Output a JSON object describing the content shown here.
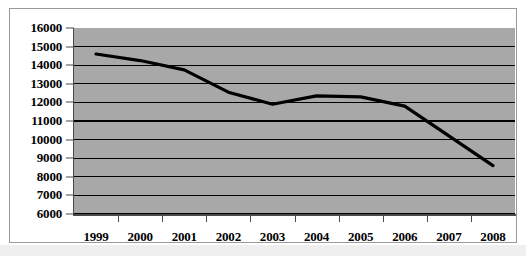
{
  "chart_data": {
    "type": "line",
    "title": "",
    "subtitle": "",
    "xlabel": "",
    "ylabel": "",
    "categories": [
      "1999",
      "2000",
      "2001",
      "2002",
      "2003",
      "2004",
      "2005",
      "2006",
      "2007",
      "2008"
    ],
    "values": [
      14600,
      14250,
      13750,
      12550,
      11900,
      12350,
      12300,
      11800,
      10200,
      8600
    ],
    "series": [
      {
        "name": "",
        "values": [
          14600,
          14250,
          13750,
          12550,
          11900,
          12350,
          12300,
          11800,
          10200,
          8600
        ]
      }
    ],
    "ylim": [
      6000,
      16000
    ],
    "ytick_step": 1000,
    "ytick_labels": [
      "16000",
      "15000",
      "14000",
      "13000",
      "12000",
      "11000",
      "10000",
      "9000",
      "8000",
      "7000",
      "6000"
    ],
    "ytick_values": [
      16000,
      15000,
      14000,
      13000,
      12000,
      11000,
      10000,
      9000,
      8000,
      7000,
      6000
    ],
    "grid": true,
    "grid_axis": "y",
    "legend": false,
    "legend_position": "none",
    "annotations": []
  },
  "style": {
    "plot_background": "#a8a8a8",
    "page_background": "#ffffff",
    "grid_color": "#000000",
    "axis_color": "#4a4a4a",
    "line_color": "#000000",
    "text_color": "#000000",
    "frame_border": "#9a9a9a"
  }
}
